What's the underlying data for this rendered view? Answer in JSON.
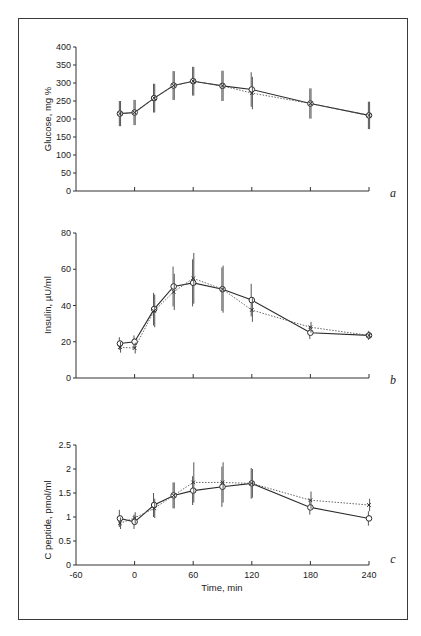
{
  "figure": {
    "x_axis": {
      "label": "Time, min",
      "ticks": [
        -60,
        0,
        60,
        120,
        180,
        240
      ],
      "range": [
        -60,
        240
      ]
    },
    "series_styles": {
      "circles": {
        "marker": "open-circle",
        "line": "solid",
        "color": "#2a2a2a"
      },
      "crosses": {
        "marker": "x",
        "line": "dotted",
        "color": "#555555"
      }
    }
  },
  "chart_data": [
    {
      "panel": "a",
      "type": "line",
      "title": "",
      "xlabel": "",
      "ylabel": "Glucose, mg %",
      "ylim": [
        0,
        400
      ],
      "yticks": [
        0,
        50,
        100,
        150,
        200,
        250,
        300,
        350,
        400
      ],
      "yticklabels": [
        "0",
        "50",
        "100",
        "150",
        "200",
        "250",
        "300",
        "350",
        "400"
      ],
      "x": [
        -15,
        0,
        20,
        40,
        60,
        90,
        120,
        180,
        240
      ],
      "grid": false,
      "series": [
        {
          "name": "circles (solid line)",
          "values": [
            215,
            218,
            258,
            293,
            305,
            292,
            282,
            243,
            210
          ],
          "error": [
            35,
            35,
            40,
            40,
            40,
            42,
            48,
            42,
            38
          ]
        },
        {
          "name": "crosses (dotted line)",
          "values": [
            215,
            218,
            258,
            293,
            305,
            292,
            272,
            243,
            210
          ],
          "error": [
            35,
            35,
            40,
            40,
            40,
            42,
            45,
            42,
            38
          ]
        }
      ]
    },
    {
      "panel": "b",
      "type": "line",
      "title": "",
      "xlabel": "",
      "ylabel": "Insulin, µU/ml",
      "ylim": [
        0,
        80
      ],
      "yticks": [
        0,
        20,
        40,
        60,
        80
      ],
      "yticklabels": [
        "0",
        "20",
        "40",
        "60",
        "80"
      ],
      "x": [
        -15,
        0,
        20,
        40,
        60,
        90,
        120,
        180,
        240
      ],
      "grid": false,
      "series": [
        {
          "name": "circles (solid line)",
          "values": [
            19,
            20,
            38,
            50.5,
            52.5,
            49,
            43,
            25,
            23.5
          ],
          "error": [
            3.5,
            3.5,
            9,
            11,
            13,
            12,
            9,
            3.5,
            2.5
          ]
        },
        {
          "name": "crosses (dotted line)",
          "values": [
            17,
            16.5,
            37,
            47.5,
            55,
            49,
            37.5,
            28,
            23.5
          ],
          "error": [
            3,
            3,
            9,
            10,
            14,
            13,
            6.5,
            3,
            2
          ]
        }
      ]
    },
    {
      "panel": "c",
      "type": "line",
      "title": "",
      "xlabel": "Time, min",
      "ylabel": "C peptide, pmol/ml",
      "ylim": [
        0,
        2.5
      ],
      "yticks": [
        0,
        0.5,
        1,
        1.5,
        2,
        2.5
      ],
      "yticklabels": [
        "0",
        "0.5",
        "1",
        "1.5",
        "2",
        "2.5"
      ],
      "x": [
        -15,
        0,
        20,
        40,
        60,
        90,
        120,
        180,
        240
      ],
      "xticks": [
        -60,
        0,
        60,
        120,
        180,
        240
      ],
      "grid": false,
      "series": [
        {
          "name": "circles (solid line)",
          "values": [
            0.97,
            0.9,
            1.25,
            1.45,
            1.55,
            1.63,
            1.7,
            1.2,
            0.97
          ],
          "error": [
            0.18,
            0.15,
            0.25,
            0.27,
            0.3,
            0.42,
            0.32,
            0.15,
            0.15
          ]
        },
        {
          "name": "crosses (dotted line)",
          "values": [
            0.87,
            0.98,
            1.18,
            1.45,
            1.72,
            1.72,
            1.7,
            1.35,
            1.25
          ],
          "error": [
            0.12,
            0.12,
            0.2,
            0.27,
            0.42,
            0.42,
            0.3,
            0.18,
            0.13
          ]
        }
      ]
    }
  ],
  "panels": {
    "a": {
      "letter": "a",
      "ylabel": "Glucose, mg %"
    },
    "b": {
      "letter": "b",
      "ylabel": "Insulin, µU/ml"
    },
    "c": {
      "letter": "c",
      "ylabel": "C peptide, pmol/ml",
      "xlabel": "Time, min"
    }
  }
}
